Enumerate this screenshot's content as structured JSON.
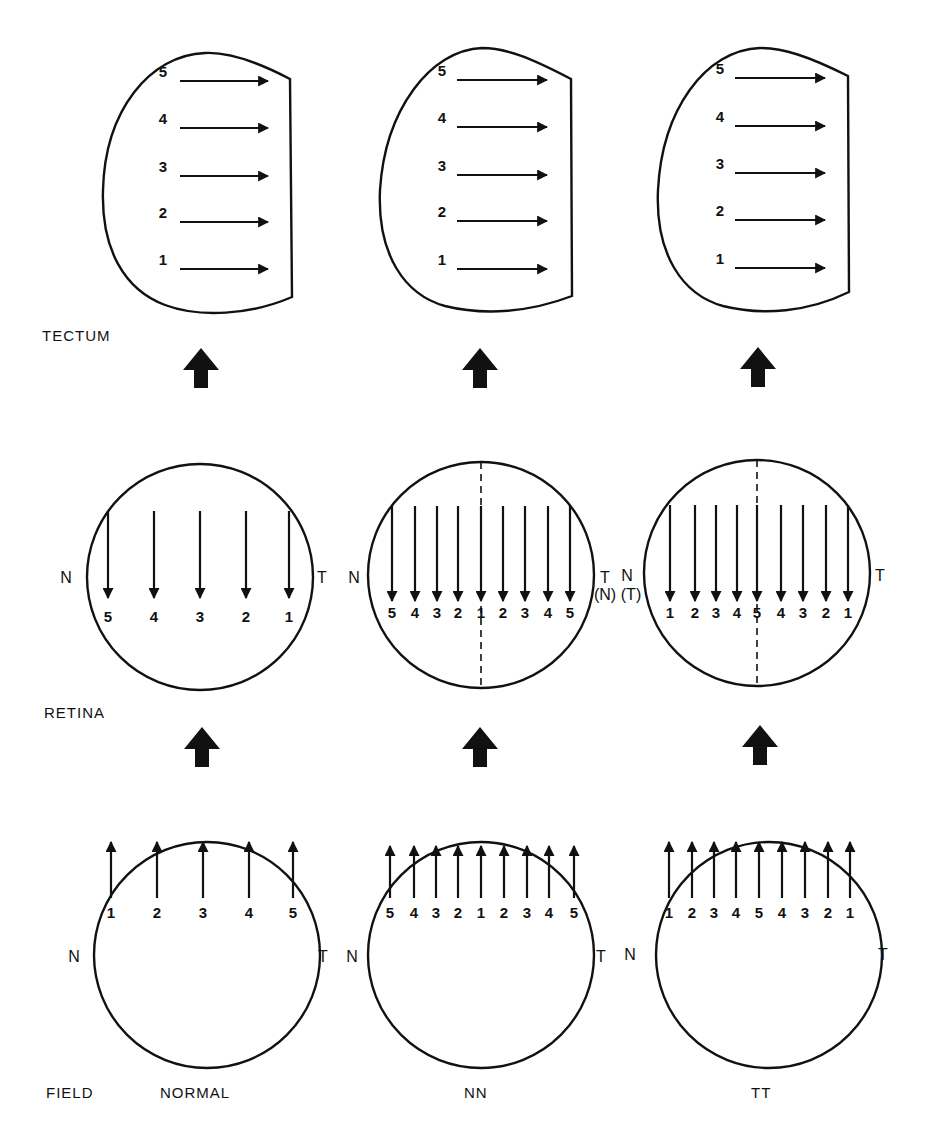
{
  "row_labels": {
    "tectum": "TECTUM",
    "retina": "RETINA",
    "field": "FIELD"
  },
  "columns": [
    {
      "name": "NORMAL",
      "tectum_numbers": [
        "5",
        "4",
        "3",
        "2",
        "1"
      ],
      "retina": {
        "left": "N",
        "right": "T",
        "numbers": [
          "5",
          "4",
          "3",
          "2",
          "1"
        ],
        "divider": false
      },
      "field": {
        "left": "N",
        "right": "T",
        "numbers": [
          "1",
          "2",
          "3",
          "4",
          "5"
        ]
      }
    },
    {
      "name": "NN",
      "tectum_numbers": [
        "5",
        "4",
        "3",
        "2",
        "1"
      ],
      "retina": {
        "left": "N",
        "right": "T",
        "right_sub": "(N)",
        "numbers": [
          "5",
          "4",
          "3",
          "2",
          "1",
          "2",
          "3",
          "4",
          "5"
        ],
        "divider": true
      },
      "field": {
        "left": "N",
        "right": "T",
        "numbers": [
          "5",
          "4",
          "3",
          "2",
          "1",
          "2",
          "3",
          "4",
          "5"
        ]
      }
    },
    {
      "name": "TT",
      "tectum_numbers": [
        "5",
        "4",
        "3",
        "2",
        "1"
      ],
      "retina": {
        "left": "N",
        "left_sub": "(T)",
        "right": "T",
        "numbers": [
          "1",
          "2",
          "3",
          "4",
          "5",
          "4",
          "3",
          "2",
          "1"
        ],
        "divider": true
      },
      "field": {
        "left": "N",
        "right": "T",
        "numbers": [
          "1",
          "2",
          "3",
          "4",
          "5",
          "4",
          "3",
          "2",
          "1"
        ]
      }
    }
  ],
  "icons": {
    "projection_arrow": "up-block-arrow"
  },
  "colors": {
    "ink": "#111111",
    "background": "#ffffff"
  }
}
